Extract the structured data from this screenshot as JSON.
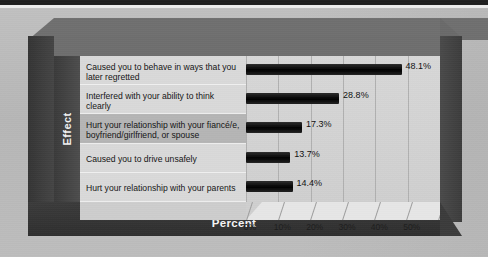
{
  "chart_data": {
    "type": "bar",
    "orientation": "horizontal",
    "title": "",
    "xlabel": "Percent",
    "ylabel": "Effect",
    "xlim": [
      0,
      60
    ],
    "xticks": [
      "0%",
      "10%",
      "20%",
      "30%",
      "40%",
      "50%"
    ],
    "xtick_values": [
      0,
      10,
      20,
      30,
      40,
      50
    ],
    "grid": true,
    "legend": "none",
    "style": "3d-perspective",
    "categories": [
      "Caused you to behave in ways that you later regretted",
      "Interfered with your ability to think clearly",
      "Hurt your relationship with your fiancé/e, boyfriend/girlfriend, or spouse",
      "Caused you to drive unsafely",
      "Hurt your relationship with your parents"
    ],
    "values": [
      48.1,
      28.8,
      17.3,
      13.7,
      14.4
    ],
    "value_labels": [
      "48.1%",
      "28.8%",
      "17.3%",
      "13.7%",
      "14.4%"
    ],
    "colors": {
      "bar": "#000000",
      "plot_background": "#d4d4d4",
      "frame": "#3b3b3b",
      "axis_rail": "#434343",
      "label_panel": "#cdcdcd",
      "text": "#141414",
      "axis_title_text": "#f4f4f4",
      "page_background": "#bababa"
    }
  },
  "axis": {
    "y_title": "Effect",
    "x_title": "Percent"
  }
}
